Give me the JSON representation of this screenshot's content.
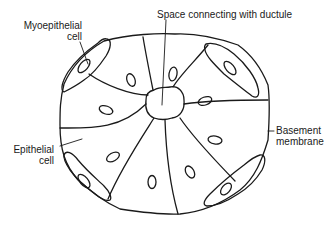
{
  "diagram": {
    "type": "anatomical-cross-section",
    "labels": {
      "myoepithelial_line1": "Myoepithelial",
      "myoepithelial_line2": "cell",
      "space_duct": "Space connecting with ductule",
      "basement_line1": "Basement",
      "basement_line2": "membrane",
      "epithelial_line1": "Epithelial",
      "epithelial_line2": "cell"
    },
    "structure": {
      "epithelial_cell_count": 8,
      "myoepithelial_cell_count": 4,
      "central_lumen": true
    },
    "colors": {
      "stroke": "#1a1a1a",
      "background": "#ffffff"
    }
  }
}
